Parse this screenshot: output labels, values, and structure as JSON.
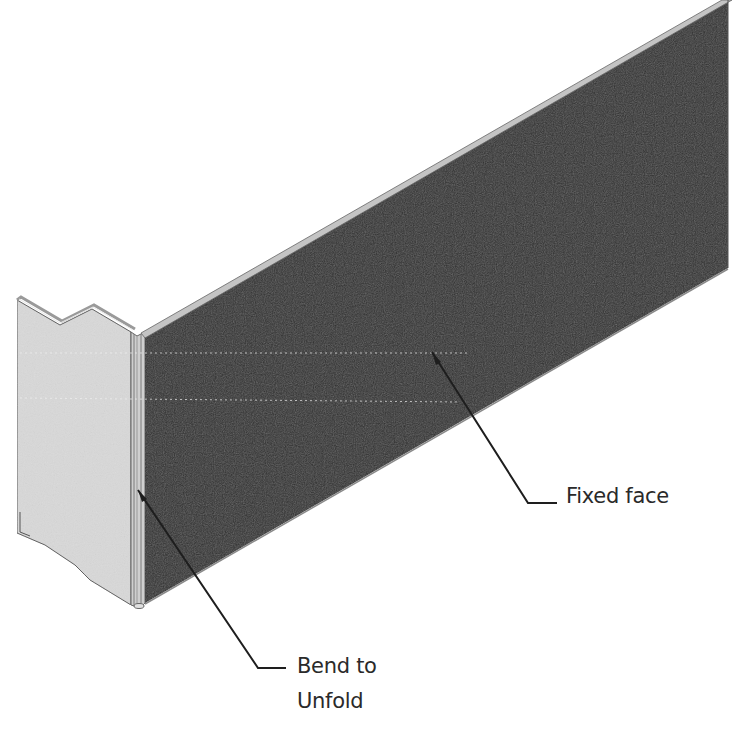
{
  "figure": {
    "colors": {
      "background": "#ffffff",
      "fixed_face": "#333333",
      "flange_face": "#d9d9d9",
      "edge_strip": "#bdbdbd",
      "outline": "#555555",
      "leader": "#1e1e1e",
      "label_text": "#2a2a2a"
    }
  },
  "callouts": {
    "fixed_face": {
      "label": "Fixed face",
      "leader_from": [
        432,
        352
      ],
      "leader_elbow": [
        528,
        503
      ],
      "leader_to": [
        557,
        503
      ]
    },
    "bend": {
      "line1": "Bend to",
      "line2": "Unfold",
      "leader_from": [
        138,
        490
      ],
      "leader_elbow": [
        258,
        668
      ],
      "leader_to": [
        286,
        668
      ]
    }
  }
}
